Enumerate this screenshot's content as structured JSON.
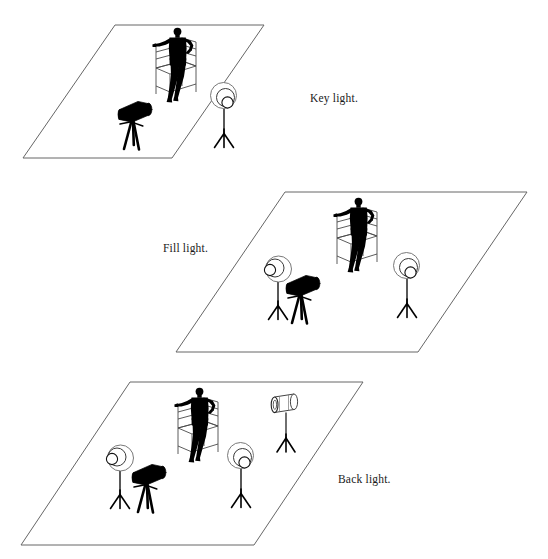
{
  "document": {
    "type": "lighting-setup-diagram",
    "background_color": "#ffffff",
    "ink_color": "#000000",
    "floor_outline_color": "#555555"
  },
  "panels": [
    {
      "id": "key-light",
      "label": "Key light.",
      "label_position": "right",
      "floor": {
        "points": "115,25 264,25 172,158 23,158"
      },
      "label_xy": {
        "x": 310,
        "y": 102
      },
      "elements": [
        {
          "name": "subject-on-chair",
          "kind": "person-seated",
          "x": 185,
          "y": 60
        },
        {
          "name": "camera-on-tripod",
          "kind": "camera",
          "x": 137,
          "y": 122,
          "facing": "right"
        },
        {
          "name": "umbrella-light-key",
          "kind": "umbrella-light",
          "x": 225,
          "y": 120,
          "facing": "left"
        }
      ]
    },
    {
      "id": "fill-light",
      "label": "Fill light.",
      "label_position": "left",
      "floor": {
        "points": "285,192 527,192 418,352 176,352"
      },
      "label_xy": {
        "x": 163,
        "y": 252
      },
      "elements": [
        {
          "name": "subject-on-chair",
          "kind": "person-seated",
          "x": 358,
          "y": 228
        },
        {
          "name": "umbrella-light-left",
          "kind": "umbrella-light",
          "x": 267,
          "y": 300,
          "facing": "right"
        },
        {
          "name": "camera-on-tripod",
          "kind": "camera",
          "x": 300,
          "y": 300,
          "facing": "right"
        },
        {
          "name": "umbrella-light-right",
          "kind": "umbrella-light",
          "x": 403,
          "y": 300,
          "facing": "left"
        }
      ]
    },
    {
      "id": "back-light",
      "label": "Back light.",
      "label_position": "right",
      "floor": {
        "points": "130,382 363,382 254,545 21,545"
      },
      "label_xy": {
        "x": 338,
        "y": 483
      },
      "elements": [
        {
          "name": "subject-on-chair",
          "kind": "person-seated",
          "x": 205,
          "y": 418
        },
        {
          "name": "umbrella-light-left",
          "kind": "umbrella-light",
          "x": 115,
          "y": 490,
          "facing": "right"
        },
        {
          "name": "camera-on-tripod",
          "kind": "camera",
          "x": 150,
          "y": 490,
          "facing": "right"
        },
        {
          "name": "umbrella-light-right",
          "kind": "umbrella-light",
          "x": 240,
          "y": 490,
          "facing": "left"
        },
        {
          "name": "back-light-cylinder",
          "kind": "cylinder-light",
          "x": 290,
          "y": 440,
          "facing": "left"
        }
      ]
    }
  ]
}
